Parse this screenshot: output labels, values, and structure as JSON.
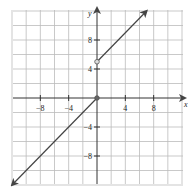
{
  "chart_data": {
    "type": "line",
    "title": "",
    "xlabel": "x",
    "ylabel": "y",
    "xlim": [
      -12,
      12
    ],
    "ylim": [
      -12,
      12
    ],
    "grid": true,
    "grid_step": 2,
    "x_ticks": [
      -8,
      -4,
      4,
      8
    ],
    "y_ticks": [
      8,
      4,
      -4,
      -8
    ],
    "x_tick_labels": [
      "−8",
      "−4",
      "4",
      "8"
    ],
    "y_tick_labels": [
      "8",
      "4",
      "−4",
      "−8"
    ],
    "series": [
      {
        "name": "y = x (x ≤ 0)",
        "points": [
          [
            -12,
            -12
          ],
          [
            0,
            0
          ]
        ],
        "start_arrow": true,
        "end_marker": "closed"
      },
      {
        "name": "y = x + 5 (x > 0)",
        "points": [
          [
            0,
            5
          ],
          [
            7,
            12
          ]
        ],
        "start_marker": "open",
        "end_arrow": true
      }
    ],
    "colors": {
      "grid": "#bbbbbb",
      "axis": "#333333",
      "line": "#444444"
    }
  }
}
